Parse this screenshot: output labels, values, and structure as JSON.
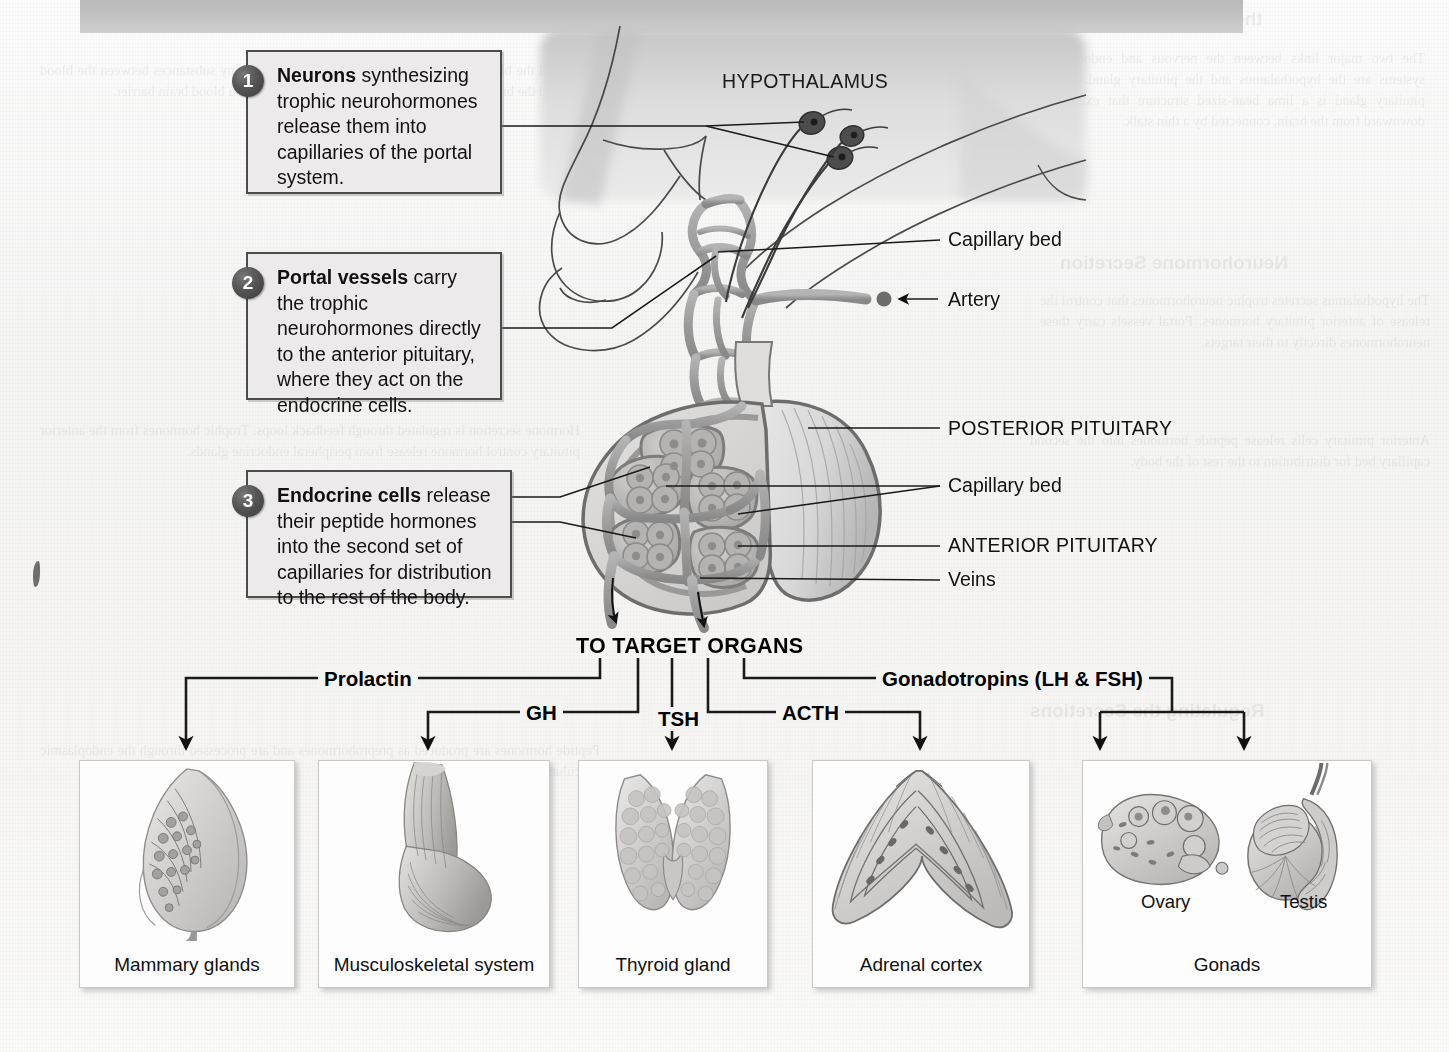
{
  "figure": {
    "title_visible": false,
    "top_bar_color": "#c4c4c4"
  },
  "callouts": [
    {
      "number": "1",
      "lead": "Neurons",
      "rest": " synthesizing trophic neurohormones release them into capillaries of the portal system."
    },
    {
      "number": "2",
      "lead": "Portal vessels",
      "rest": " carry the trophic neurohormones directly to the anterior pituitary, where they act on the endocrine cells."
    },
    {
      "number": "3",
      "lead": "Endocrine cells",
      "rest": " release their peptide hormones into the second set of capillaries for distribution to the rest of the body."
    }
  ],
  "anatomy_labels": {
    "hypothalamus": "HYPOTHALAMUS",
    "capillary_bed_upper": "Capillary bed",
    "artery": "Artery",
    "posterior_pituitary": "POSTERIOR PITUITARY",
    "capillary_bed_lower": "Capillary bed",
    "anterior_pituitary": "ANTERIOR PITUITARY",
    "veins": "Veins"
  },
  "flow": {
    "target_organs": "TO TARGET ORGANS",
    "hormones": [
      {
        "name": "Prolactin",
        "target": "Mammary glands"
      },
      {
        "name": "GH",
        "target": "Musculoskeletal system"
      },
      {
        "name": "TSH",
        "target": "Thyroid gland"
      },
      {
        "name": "ACTH",
        "target": "Adrenal cortex"
      },
      {
        "name": "Gonadotropins (LH & FSH)",
        "target": "Gonads"
      }
    ]
  },
  "organ_boxes": [
    {
      "caption": "Mammary glands",
      "art": "breast"
    },
    {
      "caption": "Musculoskeletal system",
      "art": "arm-muscle"
    },
    {
      "caption": "Thyroid gland",
      "art": "thyroid"
    },
    {
      "caption": "Adrenal cortex",
      "art": "adrenal"
    },
    {
      "caption": "Gonads",
      "art": "gonads",
      "sub_captions": [
        "Ovary",
        "Testis"
      ]
    }
  ],
  "colors": {
    "line": "#1a1a1a",
    "callout_fill": "#eceaea",
    "callout_border": "#4c4c4c",
    "badge_fill": "#4a4a4a",
    "vessel": "#9a9a9a",
    "brain_fill": "#d8d8d8"
  },
  "ghost_text": {
    "heading_1": "the Nervous System",
    "heading_2": "Neurohormone Secretion",
    "heading_3": "Regulating the Secretions",
    "col_lines": [
      "The two major links between the nervous and endocrine",
      "systems are the hypothalamus and the pituitary gland.",
      "The pituitary gland is a lima bean-sized structure that",
      "extends downward from the brain, connected by a thin",
      "stalk, the infundibulum, to the hypothalamus above it."
    ]
  }
}
